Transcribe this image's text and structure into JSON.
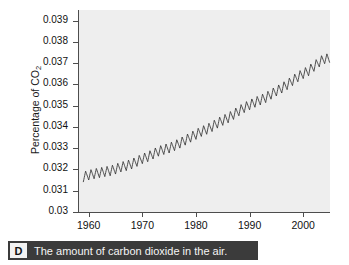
{
  "figure": {
    "caption": {
      "badge": "D",
      "text": "The amount of carbon dioxide in the air."
    }
  },
  "chart_data": {
    "type": "line",
    "title": "",
    "xlabel": "",
    "ylabel": "Percentage of CO2",
    "ylabel_display": "Percentage of CO",
    "ylabel_subscript": "2",
    "xlim": [
      1958,
      2005
    ],
    "ylim": [
      0.03,
      0.0395
    ],
    "grid": false,
    "legend": "none",
    "background_color": "#eeeeee",
    "line_color": "#3a3a3a",
    "ytick_labels": [
      "0.03",
      "0.031",
      "0.032",
      "0.033",
      "0.034",
      "0.035",
      "0.036",
      "0.037",
      "0.038",
      "0.039"
    ],
    "ytick_values": [
      0.03,
      0.031,
      0.032,
      0.033,
      0.034,
      0.035,
      0.036,
      0.037,
      0.038,
      0.039
    ],
    "xtick_labels": [
      "1960",
      "1970",
      "1980",
      "1990",
      "2000"
    ],
    "xtick_values": [
      1960,
      1970,
      1980,
      1990,
      2000
    ],
    "annotation": "Annual sawtooth oscillation superimposed on a rising trend",
    "series": [
      {
        "name": "Percentage of CO2 in air",
        "description": "Yearly mean with seasonal oscillation; values in percent",
        "x": [
          1959,
          1960,
          1961,
          1962,
          1963,
          1964,
          1965,
          1966,
          1967,
          1968,
          1969,
          1970,
          1971,
          1972,
          1973,
          1974,
          1975,
          1976,
          1977,
          1978,
          1979,
          1980,
          1981,
          1982,
          1983,
          1984,
          1985,
          1986,
          1987,
          1988,
          1989,
          1990,
          1991,
          1992,
          1993,
          1994,
          1995,
          1996,
          1997,
          1998,
          1999,
          2000,
          2001,
          2002,
          2003,
          2004
        ],
        "values": [
          0.03159,
          0.03167,
          0.03173,
          0.03178,
          0.03183,
          0.03187,
          0.03195,
          0.03205,
          0.03211,
          0.03219,
          0.03231,
          0.03244,
          0.03253,
          0.03266,
          0.03279,
          0.03287,
          0.03294,
          0.03305,
          0.03317,
          0.03331,
          0.03345,
          0.03358,
          0.03372,
          0.03382,
          0.03395,
          0.03411,
          0.03424,
          0.03436,
          0.03452,
          0.03469,
          0.03484,
          0.03497,
          0.03509,
          0.0352,
          0.03531,
          0.03547,
          0.03562,
          0.03576,
          0.03592,
          0.03611,
          0.03629,
          0.03644,
          0.03657,
          0.03678,
          0.03699,
          0.03714
        ],
        "seasonal_amplitude": 0.0003,
        "start_value": 0.0316,
        "end_value": 0.0378
      }
    ]
  }
}
